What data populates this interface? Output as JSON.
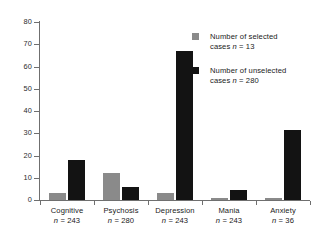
{
  "chart_data": {
    "type": "bar",
    "title": "",
    "xlabel": "",
    "ylabel": "",
    "ylim": [
      0,
      80
    ],
    "ytick_labels": [
      "0",
      "10",
      "20",
      "30",
      "40",
      "50",
      "60",
      "70",
      "80"
    ],
    "ytick_values": [
      0,
      10,
      20,
      30,
      40,
      50,
      60,
      70,
      80
    ],
    "grid": false,
    "legend_position": "upper right",
    "categories": [
      "Cognitive",
      "Psychosis",
      "Depression",
      "Mania",
      "Anxiety"
    ],
    "category_sublabels": [
      "n = 243",
      "n = 280",
      "n = 243",
      "n = 243",
      "n = 36"
    ],
    "series": [
      {
        "name": "Number of selected cases n = 13",
        "color": "#8a8a8a",
        "values": [
          3,
          12,
          3,
          1,
          1
        ]
      },
      {
        "name": "Number of unselected cases n = 280",
        "color": "#131313",
        "values": [
          18,
          6,
          67,
          4.5,
          31.5
        ]
      }
    ]
  },
  "legend": {
    "items": [
      {
        "swatch": "selected-swatch",
        "line1": "Number of selected",
        "line2_prefix": "cases ",
        "line2_italic": "n",
        "line2_suffix": " = 13"
      },
      {
        "swatch": "unselected-swatch",
        "line1": "Number of unselected",
        "line2_prefix": "cases ",
        "line2_italic": "n",
        "line2_suffix": " = 280"
      }
    ]
  },
  "axis": {
    "y_labels": [
      "80",
      "70",
      "60",
      "50",
      "40",
      "30",
      "20",
      "10",
      "0"
    ]
  },
  "categories": [
    {
      "name": "Cognitive",
      "n_prefix": "",
      "n_italic": "n",
      "n_suffix": " = 243"
    },
    {
      "name": "Psychosis",
      "n_prefix": "",
      "n_italic": "n",
      "n_suffix": " = 280"
    },
    {
      "name": "Depression",
      "n_prefix": "",
      "n_italic": "n",
      "n_suffix": " = 243"
    },
    {
      "name": "Mania",
      "n_prefix": "",
      "n_italic": "n",
      "n_suffix": " = 243"
    },
    {
      "name": "Anxiety",
      "n_prefix": "",
      "n_italic": "n",
      "n_suffix": " = 36"
    }
  ],
  "colors": {
    "selected": "#8a8a8a",
    "unselected": "#131313",
    "axis": "#6f6f6f",
    "background": "#ffffff"
  }
}
